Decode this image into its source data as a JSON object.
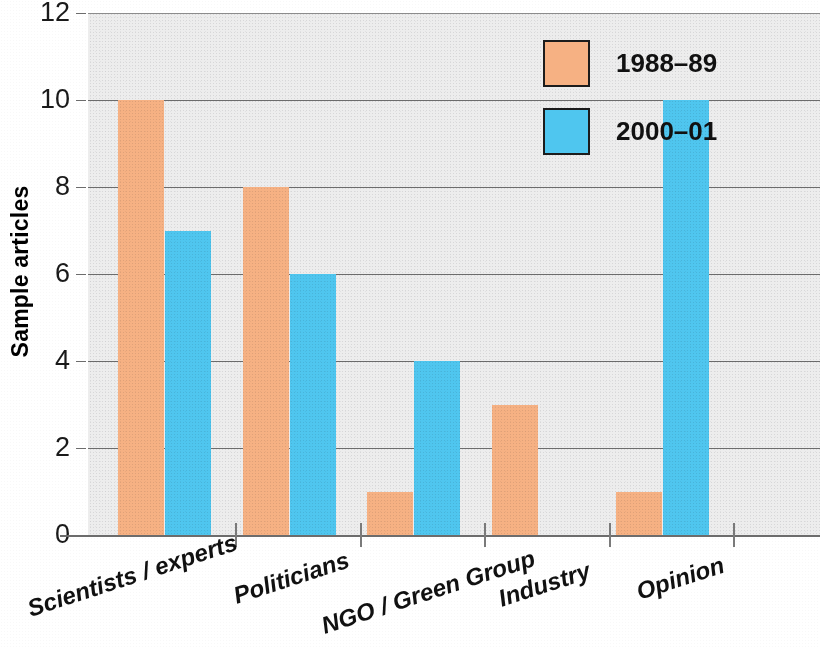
{
  "chart_data": {
    "type": "bar",
    "title": "",
    "xlabel": "",
    "ylabel": "Sample articles",
    "ylim": [
      0,
      12
    ],
    "yticks": [
      "0",
      "2",
      "4",
      "6",
      "8",
      "10",
      "12"
    ],
    "grid": true,
    "legend_position": "top-right",
    "categories": [
      "Scientists / experts",
      "Politicians",
      "NGO / Green Group",
      "Industry",
      "Opinion"
    ],
    "series": [
      {
        "name": "1988–89",
        "color": "#f6b183",
        "values": [
          10,
          8,
          1,
          3,
          1
        ]
      },
      {
        "name": "2000–01",
        "color": "#4fc6ef",
        "values": [
          7,
          6,
          4,
          0,
          10
        ]
      }
    ]
  },
  "colors": {
    "series_a": "#f6b183",
    "series_b": "#4fc6ef",
    "plot_background": "#ededed",
    "gridline": "#6c6c6c",
    "text": "#111111"
  }
}
